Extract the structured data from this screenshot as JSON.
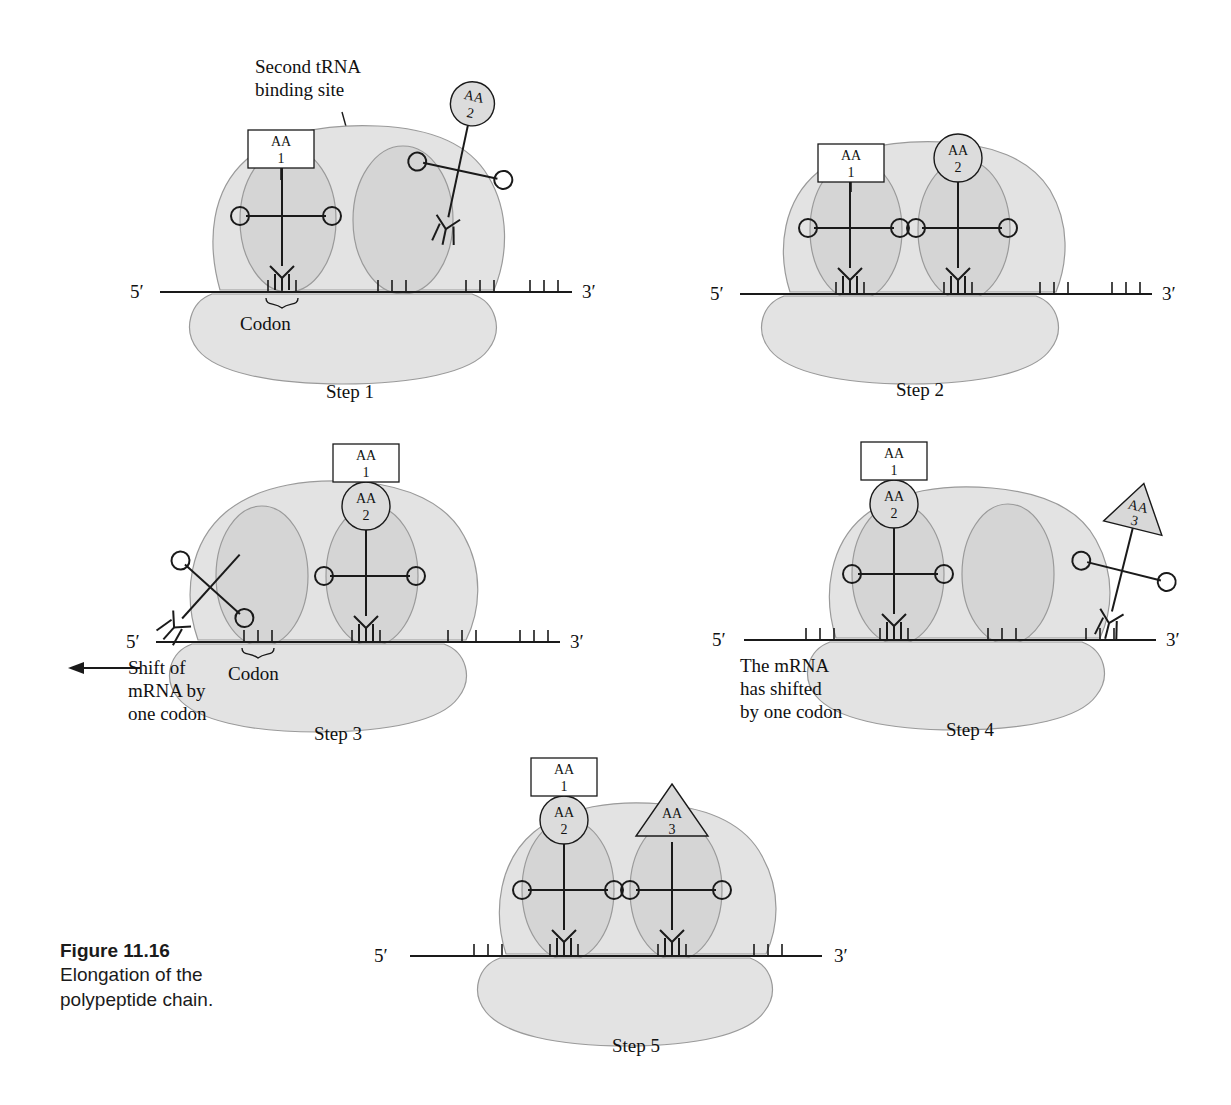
{
  "figure": {
    "number": "Figure 11.16",
    "caption": "Elongation of the\npolypeptide chain."
  },
  "colors": {
    "large_subunit_fill": "#e3e3e3",
    "binding_pocket_fill": "#d2d2d2",
    "small_subunit_fill": "#e3e3e3",
    "outline": "#8c8c8c",
    "stroke_dark": "#1a1a1a",
    "amino_acid_circle_fill": "#dcdcdc",
    "amino_acid_triangle_fill": "#d8d8d8",
    "amino_acid_box_fill": "#ffffff",
    "page_background": "#ffffff"
  },
  "common": {
    "five_prime": "5′",
    "three_prime": "3′",
    "codon_label": "Codon",
    "aa_prefix": "AA"
  },
  "panels": [
    {
      "id": "step1",
      "step_label": "Step 1",
      "annotations": [
        {
          "name": "second-trna-binding-site",
          "text": "Second tRNA\nbinding site"
        },
        {
          "name": "codon",
          "text": "Codon"
        }
      ],
      "mrna": {
        "five_prime": "5′",
        "three_prime": "3′",
        "codon_count": 4
      },
      "site_a": {
        "occupied": true,
        "amino_acid": "AA\n1",
        "aa_shape": "rectangle",
        "aa_number": "1"
      },
      "site_p": {
        "occupied": false,
        "amino_acid": null,
        "aa_shape": null
      },
      "free_trna": {
        "present": true,
        "amino_acid": "AA\n2",
        "aa_shape": "circle",
        "aa_number": "2",
        "state": "incoming"
      }
    },
    {
      "id": "step2",
      "step_label": "Step 2",
      "annotations": [],
      "mrna": {
        "five_prime": "5′",
        "three_prime": "3′",
        "codon_count": 4
      },
      "site_a": {
        "occupied": true,
        "amino_acid": "AA\n1",
        "aa_shape": "rectangle",
        "aa_number": "1"
      },
      "site_p": {
        "occupied": true,
        "amino_acid": "AA\n2",
        "aa_shape": "circle",
        "aa_number": "2"
      },
      "free_trna": {
        "present": false
      }
    },
    {
      "id": "step3",
      "step_label": "Step 3",
      "annotations": [
        {
          "name": "shift-of-mrna",
          "text": "Shift of\nmRNA by\none codon"
        },
        {
          "name": "codon",
          "text": "Codon"
        }
      ],
      "mrna": {
        "five_prime": "5′",
        "three_prime": "3′",
        "codon_count": 4
      },
      "site_a": {
        "occupied": true,
        "amino_acid": null,
        "aa_shape": null,
        "state": "uncharged-released"
      },
      "site_p": {
        "occupied": true,
        "amino_acid": "AA\n2",
        "aa_shape": "circle",
        "aa_number": "2",
        "peptide": "AA\n1"
      },
      "free_trna": {
        "present": false
      }
    },
    {
      "id": "step4",
      "step_label": "Step 4",
      "annotations": [
        {
          "name": "mrna-has-shifted",
          "text": "The mRNA\nhas shifted\nby one codon"
        }
      ],
      "mrna": {
        "five_prime": "5′",
        "three_prime": "3′",
        "codon_count": 4
      },
      "site_a": {
        "occupied": true,
        "amino_acid": "AA\n2",
        "aa_shape": "circle",
        "aa_number": "2",
        "peptide": "AA\n1"
      },
      "site_p": {
        "occupied": false,
        "amino_acid": null,
        "aa_shape": null
      },
      "free_trna": {
        "present": true,
        "amino_acid": "AA\n3",
        "aa_shape": "triangle",
        "aa_number": "3",
        "state": "incoming"
      }
    },
    {
      "id": "step5",
      "step_label": "Step 5",
      "annotations": [],
      "mrna": {
        "five_prime": "5′",
        "three_prime": "3′",
        "codon_count": 4
      },
      "site_a": {
        "occupied": true,
        "amino_acid": "AA\n2",
        "aa_shape": "circle",
        "aa_number": "2",
        "peptide": "AA\n1"
      },
      "site_p": {
        "occupied": true,
        "amino_acid": "AA\n3",
        "aa_shape": "triangle",
        "aa_number": "3"
      },
      "free_trna": {
        "present": false
      }
    }
  ]
}
